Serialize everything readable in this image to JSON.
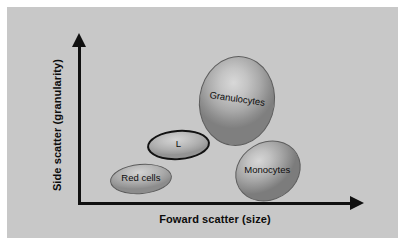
{
  "figure": {
    "background_color": "#ffffff",
    "panel_color": "#c8c8c8",
    "axis_color": "#101010"
  },
  "chart_data": {
    "type": "scatter",
    "title": "",
    "subtitle": "",
    "xlabel": "Foward scatter (size)",
    "ylabel": "Side scatter (granularity)",
    "grid": false,
    "legend": false,
    "axis_style": "arrow",
    "xlim": [
      0,
      100
    ],
    "ylim": [
      0,
      100
    ],
    "xticks": [],
    "yticks": [],
    "annotations": [],
    "populations": [
      {
        "name": "Red cells",
        "label": "Red cells",
        "x": 17,
        "y": 16,
        "width": 22,
        "height": 19,
        "rotation": -5,
        "outline": "thin",
        "fill": "#b4b4b4"
      },
      {
        "name": "Lymphocytes",
        "label": "L",
        "x": 30,
        "y": 38,
        "width": 23,
        "height": 19,
        "rotation": -4,
        "outline": "thick",
        "fill": "#bdbdbd"
      },
      {
        "name": "Granulocytes",
        "label": "Granulocytes",
        "x": 49,
        "y": 73,
        "width": 28,
        "height": 57,
        "rotation": 8,
        "outline": "thin",
        "fill": "#b0b0b0"
      },
      {
        "name": "Monocytes",
        "label": "Monocytes",
        "x": 66,
        "y": 26,
        "width": 25,
        "height": 37,
        "rotation": -31,
        "outline": "thin",
        "fill": "#aeaeae"
      }
    ]
  }
}
